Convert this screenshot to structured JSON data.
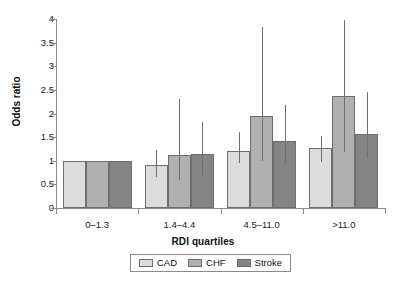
{
  "chart_data": {
    "type": "bar",
    "title": "",
    "xlabel": "RDI quartiles",
    "ylabel": "Odds ratio",
    "categories": [
      "0–1.3",
      "1.4–4.4",
      "4.5–11.0",
      ">11.0"
    ],
    "ylim": [
      0,
      4
    ],
    "yticks": [
      "0",
      "0.5",
      "1",
      "1.5",
      "2",
      "2.5",
      "3",
      "3.5",
      "4"
    ],
    "ytick_values": [
      0,
      0.5,
      1,
      1.5,
      2,
      2.5,
      3,
      3.5,
      4
    ],
    "grid": false,
    "legend_position": "bottom",
    "series": [
      {
        "name": "CAD",
        "color": "#dcdcdc",
        "values": [
          1.0,
          0.92,
          1.2,
          1.26
        ],
        "error_low": [
          null,
          0.66,
          0.95,
          0.97
        ],
        "error_high": [
          null,
          1.22,
          1.6,
          1.52
        ]
      },
      {
        "name": "CHF",
        "color": "#b0b0b0",
        "values": [
          1.0,
          1.13,
          1.95,
          2.37
        ],
        "error_low": [
          null,
          0.59,
          0.99,
          1.19
        ],
        "error_high": [
          null,
          2.3,
          3.83,
          3.97
        ]
      },
      {
        "name": "Stroke",
        "color": "#848484",
        "values": [
          1.0,
          1.15,
          1.42,
          1.57
        ],
        "error_low": [
          null,
          0.69,
          0.93,
          1.05
        ],
        "error_high": [
          null,
          1.81,
          2.19,
          2.45
        ]
      }
    ]
  },
  "axis": {
    "y_title": "Odds ratio",
    "x_title": "RDI quartiles"
  },
  "legend": {
    "items": [
      {
        "label": "CAD"
      },
      {
        "label": "CHF"
      },
      {
        "label": "Stroke"
      }
    ]
  }
}
